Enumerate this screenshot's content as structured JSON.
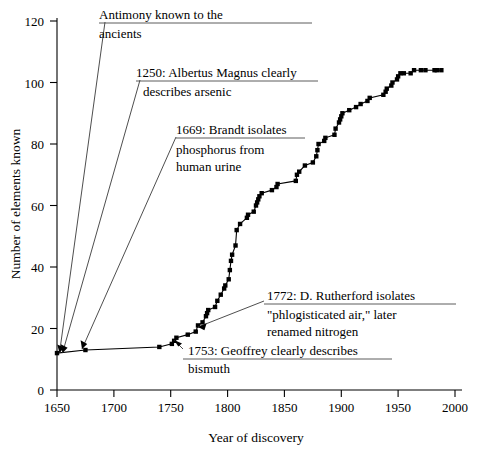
{
  "chart_data": {
    "type": "line",
    "title": "",
    "xlabel": "Year of discovery",
    "ylabel": "Number of elements known",
    "xlim": [
      1650,
      2000
    ],
    "ylim": [
      0,
      120
    ],
    "xticks": [
      1650,
      1700,
      1750,
      1800,
      1850,
      1900,
      1950,
      2000
    ],
    "yticks": [
      0,
      20,
      40,
      60,
      80,
      100,
      120
    ],
    "grid": false,
    "legend": "none",
    "marker": "filled-square",
    "series": [
      {
        "name": "Cumulative elements known",
        "x": [
          1650,
          1675,
          1740,
          1751,
          1753,
          1755,
          1765,
          1772,
          1774,
          1778,
          1781,
          1782,
          1783,
          1789,
          1791,
          1794,
          1797,
          1798,
          1801,
          1802,
          1803,
          1804,
          1807,
          1808,
          1811,
          1817,
          1818,
          1823,
          1825,
          1826,
          1827,
          1828,
          1830,
          1839,
          1843,
          1844,
          1860,
          1861,
          1863,
          1868,
          1875,
          1878,
          1879,
          1880,
          1885,
          1886,
          1894,
          1895,
          1898,
          1899,
          1900,
          1901,
          1907,
          1913,
          1917,
          1923,
          1925,
          1937,
          1939,
          1940,
          1944,
          1945,
          1949,
          1950,
          1952,
          1955,
          1961,
          1964,
          1970,
          1974,
          1982,
          1984,
          1988
        ],
        "y": [
          12,
          13,
          14,
          15,
          16,
          17,
          18,
          19,
          21,
          22,
          24,
          25,
          26,
          27,
          29,
          31,
          33,
          34,
          36,
          39,
          42,
          44,
          47,
          52,
          54,
          56,
          57,
          58,
          60,
          61,
          62,
          63,
          64,
          65,
          66,
          67,
          68,
          70,
          71,
          73,
          74,
          76,
          78,
          80,
          81,
          82,
          83,
          85,
          87,
          88,
          89,
          90,
          91,
          92,
          93,
          94,
          95,
          96,
          97,
          98,
          99,
          100,
          101,
          102,
          103,
          103,
          103,
          104,
          104,
          104,
          104,
          104,
          104
        ]
      }
    ],
    "annotations": [
      {
        "id": "antimony",
        "lines": [
          "Antimony known to the",
          "ancients"
        ],
        "points_to_year": 1650,
        "points_to_value": 12
      },
      {
        "id": "arsenic",
        "lines": [
          "1250: Albertus Magnus clearly",
          "describes arsenic"
        ],
        "points_to_year": 1650,
        "points_to_value": 12
      },
      {
        "id": "phosphorus",
        "lines": [
          "1669: Brandt isolates",
          "phosphorus from",
          "human urine"
        ],
        "points_to_year": 1675,
        "points_to_value": 13
      },
      {
        "id": "nitrogen",
        "lines": [
          "1772: D. Rutherford isolates",
          "\"phlogisticated air,\" later",
          "renamed nitrogen"
        ],
        "points_to_year": 1772,
        "points_to_value": 19
      },
      {
        "id": "bismuth",
        "lines": [
          "1753: Geoffrey clearly describes",
          "bismuth"
        ],
        "points_to_year": 1753,
        "points_to_value": 16
      }
    ]
  },
  "axis": {
    "y_title": "Number of elements known",
    "x_title": "Year of discovery",
    "x_tick_labels": [
      "1650",
      "1700",
      "1750",
      "1800",
      "1850",
      "1900",
      "1950",
      "2000"
    ],
    "y_tick_labels": [
      "0",
      "20",
      "40",
      "60",
      "80",
      "100",
      "120"
    ]
  },
  "annotations_text": {
    "antimony_l1": "Antimony known to the",
    "antimony_l2": "ancients",
    "arsenic_l1": "1250: Albertus Magnus clearly",
    "arsenic_l2": "describes arsenic",
    "phosphorus_l1": "1669: Brandt isolates",
    "phosphorus_l2": "phosphorus from",
    "phosphorus_l3": "human urine",
    "nitrogen_l1": "1772: D. Rutherford isolates",
    "nitrogen_l2": "\"phlogisticated air,\" later",
    "nitrogen_l3": "renamed nitrogen",
    "bismuth_l1": "1753: Geoffrey clearly describes",
    "bismuth_l2": "bismuth"
  },
  "colors": {
    "ink": "#000000",
    "leader": "#3a3a3a",
    "background": "#ffffff"
  }
}
